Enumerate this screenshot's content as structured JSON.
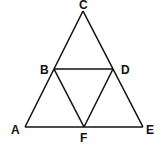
{
  "diagram": {
    "points": {
      "A": {
        "label": "A",
        "x": 25,
        "y": 127
      },
      "B": {
        "label": "B",
        "x": 54,
        "y": 69
      },
      "C": {
        "label": "C",
        "x": 83,
        "y": 11
      },
      "D": {
        "label": "D",
        "x": 113,
        "y": 69
      },
      "E": {
        "label": "E",
        "x": 143,
        "y": 127
      },
      "F": {
        "label": "F",
        "x": 84,
        "y": 127
      }
    },
    "segments": [
      "AC",
      "CE",
      "AE",
      "BD",
      "BF",
      "DF"
    ],
    "line_color": "#111111"
  }
}
